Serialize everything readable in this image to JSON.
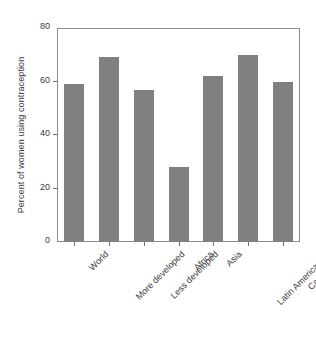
{
  "chart_data": {
    "type": "bar",
    "title": "",
    "xlabel": "",
    "ylabel": "Percent of women using contraception",
    "categories": [
      "World",
      "More developed",
      "Less developed",
      "Africa",
      "Asia",
      "Latin America and Carribean",
      "South Asia and Oceania"
    ],
    "category_lines": [
      [
        "World"
      ],
      [
        "More developed"
      ],
      [
        "Less developed"
      ],
      [
        "Africa"
      ],
      [
        "Asia"
      ],
      [
        "Latin America and",
        "Carribean"
      ],
      [
        "South Asia and Oceania"
      ]
    ],
    "values": [
      59,
      69,
      57,
      28,
      62,
      70,
      60
    ],
    "ylim": [
      0,
      80
    ],
    "yticks": [
      0,
      20,
      40,
      60,
      80
    ],
    "ytick_labels": [
      "0",
      "20",
      "40",
      "60",
      "80"
    ],
    "grid": false,
    "legend": false,
    "bar_color": "#808080",
    "axis_color": "#8c8c8c",
    "background": "#ffffff"
  }
}
